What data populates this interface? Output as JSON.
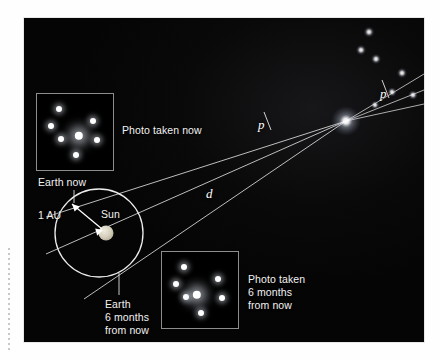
{
  "figure": {
    "title_semantic": "stellar-parallax-diagram",
    "background_color": "#060607",
    "frame_color": "#e8e8e8",
    "labels": {
      "photo_now": "Photo taken now",
      "photo_six_months": "Photo taken\n6 months\nfrom now",
      "earth_now": "Earth now",
      "earth_six_months": "Earth\n6 months\nfrom now",
      "sun": "Sun",
      "one_au": "1 AU",
      "distance": "d",
      "parallax_left": "p",
      "parallax_right": "p"
    },
    "sun": {
      "cx": 82,
      "cy": 215,
      "r": 7.5,
      "color": "#d9d2c2"
    },
    "orbit": {
      "cx": 75,
      "cy": 215,
      "rx": 43,
      "ry": 44,
      "stroke": "#e6e6e6"
    },
    "target_star": {
      "cx": 322,
      "cy": 103,
      "color": "#ffffff",
      "glow_radius": 14
    },
    "earth_now_point": {
      "x": 52,
      "y": 182
    },
    "earth_later_point": {
      "x": 98,
      "y": 252
    },
    "sight_lines": [
      {
        "name": "earth-now-to-star",
        "x1": 30,
        "y1": 196,
        "x2": 322,
        "y2": 103
      },
      {
        "name": "sun-to-star",
        "x1": 30,
        "y1": 233,
        "x2": 322,
        "y2": 103
      },
      {
        "name": "earth-later-to-star",
        "x1": 68,
        "y1": 275,
        "x2": 322,
        "y2": 103
      },
      {
        "name": "star-to-background-a",
        "x1": 322,
        "y1": 103,
        "x2": 400,
        "y2": 60
      },
      {
        "name": "star-to-background-b",
        "x1": 322,
        "y1": 103,
        "x2": 400,
        "y2": 75
      },
      {
        "name": "star-to-background-c",
        "x1": 322,
        "y1": 103,
        "x2": 400,
        "y2": 88
      }
    ],
    "background_stars": [
      {
        "cx": 345,
        "cy": 14,
        "r": 3.2
      },
      {
        "cx": 337,
        "cy": 32,
        "r": 3.0
      },
      {
        "cx": 352,
        "cy": 41,
        "r": 3.0
      },
      {
        "cx": 378,
        "cy": 55,
        "r": 3.0
      },
      {
        "cx": 368,
        "cy": 74,
        "r": 2.8
      },
      {
        "cx": 388,
        "cy": 77,
        "r": 2.8
      },
      {
        "cx": 350,
        "cy": 86,
        "r": 2.6
      }
    ],
    "inset_now": {
      "name": "photo-taken-now-inset",
      "x": 12,
      "y": 75,
      "w": 76,
      "h": 76,
      "border": "#8d8d8d",
      "stars": [
        {
          "cx": 22,
          "cy": 15,
          "r": 3.0,
          "bright": false
        },
        {
          "cx": 14,
          "cy": 32,
          "r": 3.0,
          "bright": false
        },
        {
          "cx": 24,
          "cy": 45,
          "r": 3.0,
          "bright": false
        },
        {
          "cx": 56,
          "cy": 27,
          "r": 3.0,
          "bright": false
        },
        {
          "cx": 42,
          "cy": 42,
          "r": 4.2,
          "bright": true
        },
        {
          "cx": 60,
          "cy": 46,
          "r": 3.0,
          "bright": false
        },
        {
          "cx": 39,
          "cy": 61,
          "r": 3.0,
          "bright": false
        }
      ]
    },
    "inset_later": {
      "name": "photo-taken-six-months-inset",
      "x": 137,
      "y": 233,
      "w": 76,
      "h": 76,
      "border": "#8d8d8d",
      "stars": [
        {
          "cx": 22,
          "cy": 15,
          "r": 3.0,
          "bright": false
        },
        {
          "cx": 14,
          "cy": 32,
          "r": 3.0,
          "bright": false
        },
        {
          "cx": 24,
          "cy": 45,
          "r": 3.0,
          "bright": false
        },
        {
          "cx": 56,
          "cy": 27,
          "r": 3.0,
          "bright": false
        },
        {
          "cx": 35,
          "cy": 43,
          "r": 4.2,
          "bright": true
        },
        {
          "cx": 60,
          "cy": 46,
          "r": 3.0,
          "bright": false
        },
        {
          "cx": 39,
          "cy": 61,
          "r": 3.0,
          "bright": false
        }
      ]
    }
  }
}
